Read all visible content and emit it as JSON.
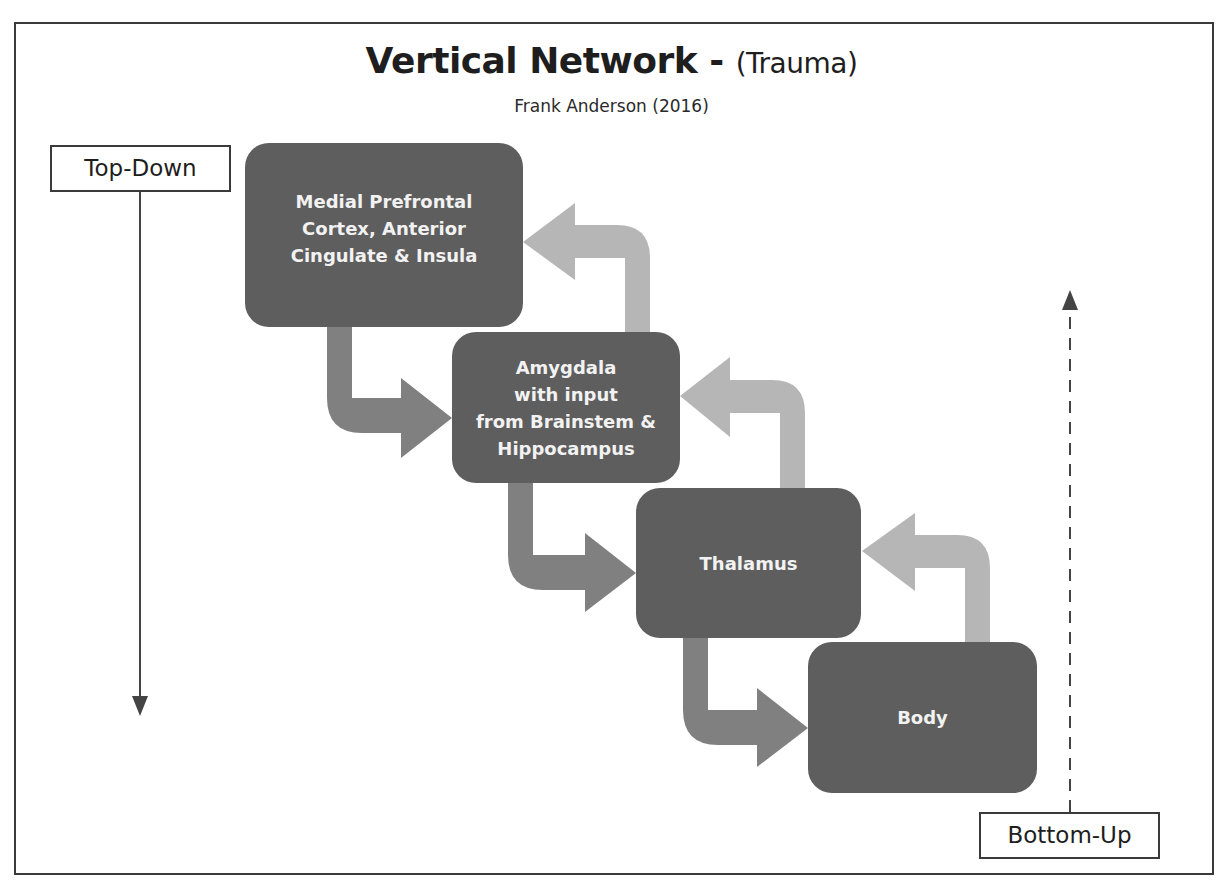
{
  "header": {
    "title_main": "Vertical Network - ",
    "title_sub": "(Trauma)",
    "subtitle": "Frank Anderson (2016)"
  },
  "axes": {
    "top_down_label": "Top-Down",
    "bottom_up_label": "Bottom-Up"
  },
  "nodes": [
    {
      "id": "mpfc",
      "label": "Medial Prefrontal\nCortex, Anterior\nCingulate & Insula"
    },
    {
      "id": "amygdala",
      "label": "Amygdala\nwith input\nfrom Brainstem &\nHippocampus"
    },
    {
      "id": "thalamus",
      "label": "Thalamus"
    },
    {
      "id": "body",
      "label": "Body"
    }
  ],
  "colors": {
    "node_fill": "#5e5e5e",
    "down_arrow": "#808080",
    "up_arrow": "#b6b6b6",
    "frame": "#3a3a3a"
  },
  "edges": [
    {
      "from": "mpfc",
      "to": "amygdala",
      "direction": "top-down"
    },
    {
      "from": "amygdala",
      "to": "thalamus",
      "direction": "top-down"
    },
    {
      "from": "thalamus",
      "to": "body",
      "direction": "top-down"
    },
    {
      "from": "amygdala",
      "to": "mpfc",
      "direction": "bottom-up"
    },
    {
      "from": "thalamus",
      "to": "amygdala",
      "direction": "bottom-up"
    },
    {
      "from": "body",
      "to": "thalamus",
      "direction": "bottom-up"
    }
  ]
}
